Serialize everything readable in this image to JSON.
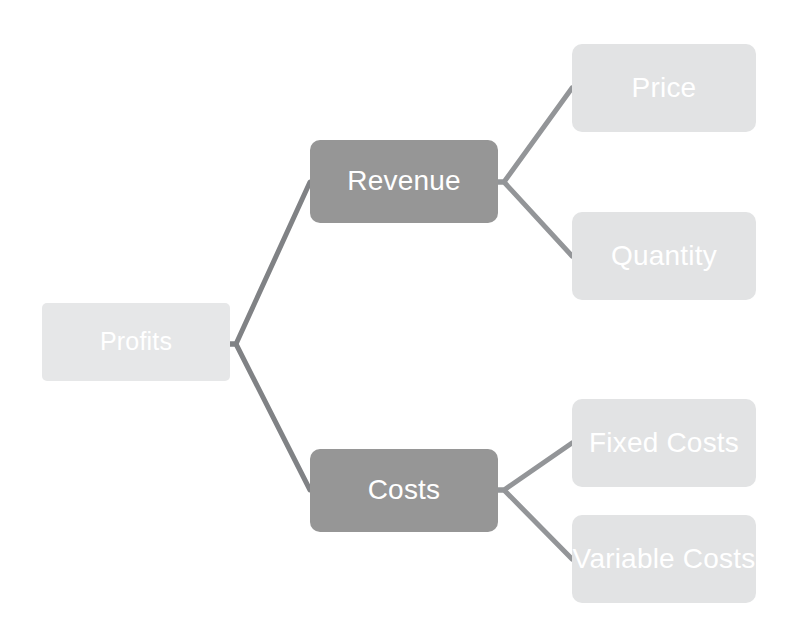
{
  "diagram": {
    "type": "tree",
    "orientation": "left-to-right",
    "colors": {
      "background": "#ffffff",
      "root_fill": "#e6e7e8",
      "branch_fill": "#969696",
      "leaf_fill": "#e2e3e4",
      "label_text": "#ffffff",
      "connector": "#808285"
    },
    "nodes": [
      {
        "id": "profits",
        "label": "Profits",
        "level": 0,
        "style": "root",
        "x": 42,
        "y": 303,
        "width": 188,
        "height": 78,
        "font_size": 25
      },
      {
        "id": "revenue",
        "label": "Revenue",
        "level": 1,
        "style": "branch",
        "x": 310,
        "y": 140,
        "width": 188,
        "height": 83,
        "font_size": 28
      },
      {
        "id": "costs",
        "label": "Costs",
        "level": 1,
        "style": "branch",
        "x": 310,
        "y": 449,
        "width": 188,
        "height": 83,
        "font_size": 28
      },
      {
        "id": "price",
        "label": "Price",
        "level": 2,
        "style": "leaf",
        "x": 572,
        "y": 44,
        "width": 184,
        "height": 88,
        "font_size": 28
      },
      {
        "id": "quantity",
        "label": "Quantity",
        "level": 2,
        "style": "leaf",
        "x": 572,
        "y": 212,
        "width": 184,
        "height": 88,
        "font_size": 28
      },
      {
        "id": "fixed-costs",
        "label": "Fixed Costs",
        "level": 2,
        "style": "leaf",
        "x": 572,
        "y": 399,
        "width": 184,
        "height": 88,
        "font_size": 28
      },
      {
        "id": "variable-costs",
        "label": "Variable Costs",
        "level": 2,
        "style": "leaf",
        "x": 572,
        "y": 515,
        "width": 184,
        "height": 88,
        "font_size": 28
      }
    ],
    "edges": [
      {
        "id": "profits-revenue",
        "from": "profits",
        "to": "revenue",
        "points": "230,344 236,344 310,182"
      },
      {
        "id": "profits-costs",
        "from": "profits",
        "to": "costs",
        "points": "230,344 236,344 310,490"
      },
      {
        "id": "revenue-price",
        "from": "revenue",
        "to": "price",
        "points": "498,182 504,182 572,88"
      },
      {
        "id": "revenue-quantity",
        "from": "revenue",
        "to": "quantity",
        "points": "498,182 504,182 572,256"
      },
      {
        "id": "costs-fixed",
        "from": "costs",
        "to": "fixed-costs",
        "points": "498,490 504,490 572,443"
      },
      {
        "id": "costs-variable",
        "from": "costs",
        "to": "variable-costs",
        "points": "498,490 504,490 572,559"
      }
    ]
  }
}
